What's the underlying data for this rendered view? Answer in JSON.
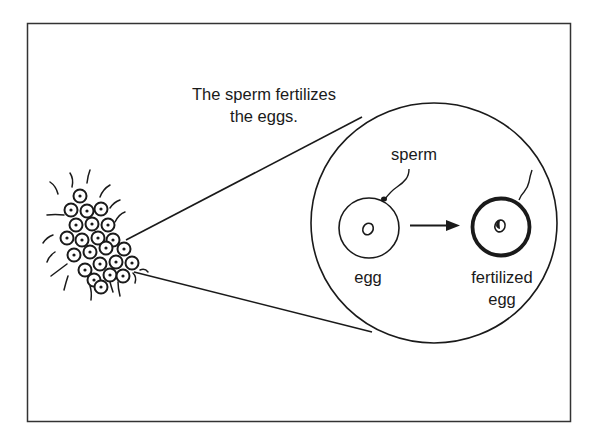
{
  "diagram": {
    "caption": {
      "line1": "The sperm fertilizes",
      "line2": "the eggs."
    },
    "labels": {
      "sperm": "sperm",
      "egg": "egg",
      "fertilized_line1": "fertilized",
      "fertilized_line2": "egg"
    },
    "colors": {
      "ink": "#1a1a1a",
      "background": "#ffffff",
      "frame": "#333333"
    }
  }
}
